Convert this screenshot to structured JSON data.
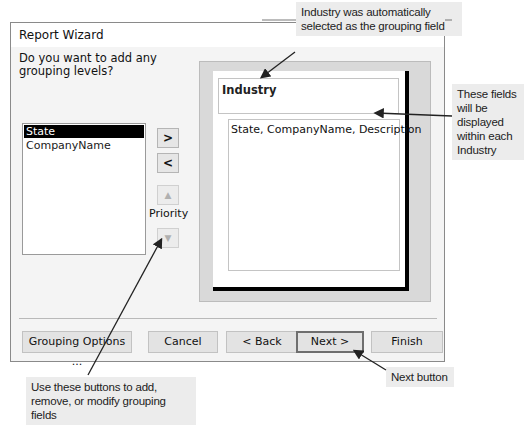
{
  "dialog": {
    "title": "Report Wizard",
    "question": "Do you want to add any grouping levels?",
    "available_fields": [
      {
        "label": "State",
        "selected": true
      },
      {
        "label": "CompanyName",
        "selected": false
      }
    ],
    "buttons": {
      "add": ">",
      "remove": "<",
      "priority_up": "▲",
      "priority_down": "▼",
      "priority_label": "Priority"
    },
    "preview": {
      "group_field": "Industry",
      "detail_fields": "State, CompanyName, Description"
    },
    "footer": {
      "grouping_options": "Grouping Options ...",
      "cancel": "Cancel",
      "back": "< Back",
      "next": "Next >",
      "finish": "Finish"
    }
  },
  "callouts": {
    "industry": "Industry was automatically selected as the grouping field",
    "fields": "These fields will be displayed within each Industry",
    "grouping_buttons": "Use these buttons to add, remove, or modify grouping fields",
    "next_button": "Next button"
  }
}
